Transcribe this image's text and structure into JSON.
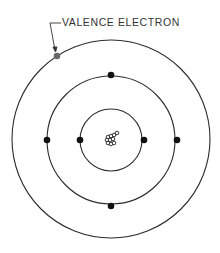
{
  "diagram": {
    "annotation": {
      "label": "VALENCE ELECTRON",
      "target": "valence-electron"
    },
    "nucleus": {
      "cx": 111,
      "cy": 140
    },
    "shells": [
      {
        "name": "inner",
        "r": 31,
        "electrons": [
          [
            80,
            140
          ],
          [
            142,
            140
          ]
        ]
      },
      {
        "name": "middle",
        "r": 64,
        "electrons": [
          [
            111,
            76
          ],
          [
            47,
            140
          ],
          [
            175,
            140
          ],
          [
            111,
            206
          ]
        ]
      },
      {
        "name": "outer",
        "r": 98,
        "electrons": [
          [
            57,
            56
          ]
        ]
      }
    ],
    "colors": {
      "line": "#2b2b2b",
      "electron": "#111111",
      "valence": "#666666"
    }
  }
}
